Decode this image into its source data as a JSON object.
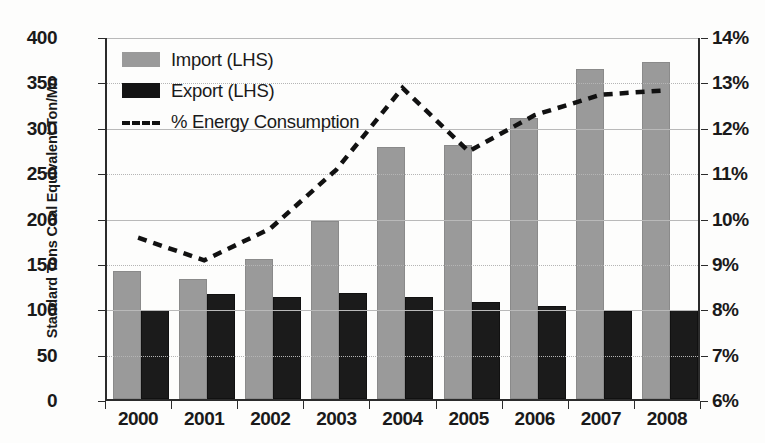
{
  "chart_data": {
    "type": "bar",
    "title": "",
    "categories": [
      "2000",
      "2001",
      "2002",
      "2003",
      "2004",
      "2005",
      "2006",
      "2007",
      "2008"
    ],
    "xlabel": "",
    "ylabel": "Standard Tons Coal Equivalent Ton/Mn",
    "ylim": [
      0,
      400
    ],
    "ytick_labels": [
      "400",
      "350",
      "300",
      "250",
      "200",
      "150",
      "100",
      "50",
      "0"
    ],
    "ytick_values": [
      400,
      350,
      300,
      250,
      200,
      150,
      100,
      50,
      0
    ],
    "y2label": "",
    "y2lim": [
      6,
      14
    ],
    "y2tick_labels": [
      "14%",
      "13%",
      "12%",
      "11%",
      "10%",
      "9%",
      "8%",
      "7%",
      "6%"
    ],
    "y2tick_values": [
      14,
      13,
      12,
      11,
      10,
      9,
      8,
      7,
      6
    ],
    "grid": true,
    "legend_position": "top-left",
    "series": [
      {
        "name": "Import (LHS)",
        "type": "bar",
        "axis": "left",
        "color": "#9a9a9a",
        "values": [
          139,
          130,
          152,
          194,
          275,
          278,
          307,
          361,
          369
        ]
      },
      {
        "name": "Export (LHS)",
        "type": "bar",
        "axis": "left",
        "color": "#141414",
        "values": [
          96,
          114,
          110,
          115,
          110,
          105,
          100,
          95,
          96
        ]
      },
      {
        "name": "% Energy Consumption",
        "type": "line",
        "axis": "right",
        "style": "dashed",
        "color": "#111111",
        "values": [
          9.6,
          9.1,
          9.8,
          11.1,
          12.9,
          11.5,
          12.3,
          12.75,
          12.85
        ]
      }
    ]
  },
  "legend": {
    "items": [
      {
        "label": "Import (LHS)",
        "marker": "square-gray"
      },
      {
        "label": "Export (LHS)",
        "marker": "square-black"
      },
      {
        "label": "% Energy Consumption",
        "marker": "dashed-line"
      }
    ]
  },
  "axis_titles": {
    "y_left": "Standard Tons Coal Equivalent Ton/Mn"
  }
}
